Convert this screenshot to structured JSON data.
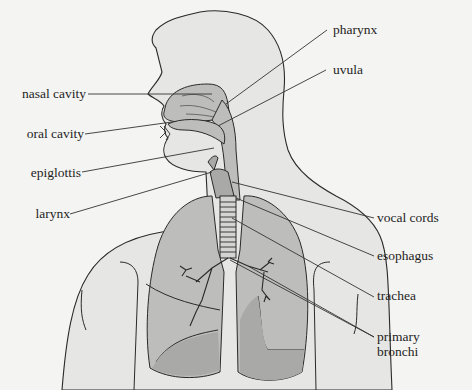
{
  "diagram": {
    "colors": {
      "background": "#f4f4f2",
      "skin": "#e6e6e4",
      "organ_fill": "#bdbdbb",
      "organ_dark": "#a9a9a7",
      "outline": "#2a2a2a",
      "leader": "#333333"
    },
    "labels_left": [
      {
        "id": "nasal-cavity",
        "text": "nasal cavity"
      },
      {
        "id": "oral-cavity",
        "text": "oral cavity"
      },
      {
        "id": "epiglottis",
        "text": "epiglottis"
      },
      {
        "id": "larynx",
        "text": "larynx"
      }
    ],
    "labels_right": [
      {
        "id": "pharynx",
        "text": "pharynx"
      },
      {
        "id": "uvula",
        "text": "uvula"
      },
      {
        "id": "vocal-cords",
        "text": "vocal cords"
      },
      {
        "id": "esophagus",
        "text": "esophagus"
      },
      {
        "id": "trachea",
        "text": "trachea"
      },
      {
        "id": "primary-bronchi",
        "text": "primary bronchi"
      }
    ]
  }
}
